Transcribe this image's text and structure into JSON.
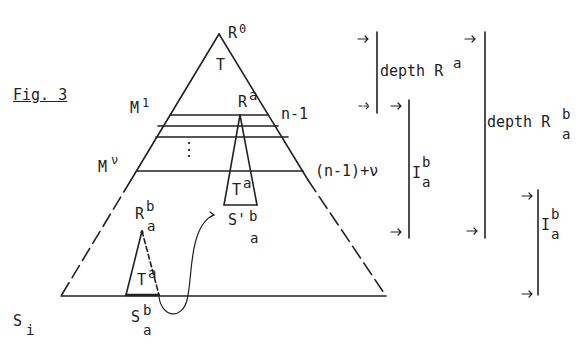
{
  "figure": {
    "caption": "Fig. 3",
    "colors": {
      "ink": "#222222",
      "background": "#ffffff"
    }
  },
  "triangle": {
    "apex_label": "R",
    "apex_sup": "0",
    "body_label": "T",
    "base_label": "S",
    "base_sub": "i"
  },
  "levels": [
    {
      "left_label": "M",
      "left_sup": "1",
      "right_label": "n-1"
    },
    {
      "ellipsis": "⋮"
    },
    {
      "left_label": "M",
      "left_sup": "ν",
      "right_label": "(n-1)+ν"
    }
  ],
  "subtrees": {
    "upper": {
      "apex_label": "R",
      "apex_sup": "a",
      "body_label": "T",
      "body_sup": "a",
      "base_label": "S'",
      "base_sup": "b",
      "base_sub": "a"
    },
    "lower": {
      "apex_label": "R",
      "apex_sup": "b",
      "apex_sub": "a",
      "body_label": "T",
      "body_sup": "a",
      "base_label": "S",
      "base_sup": "b",
      "base_sub": "a"
    }
  },
  "brackets": [
    {
      "label": "depth R",
      "sup": "a"
    },
    {
      "label": "I",
      "sup": "b",
      "sub": "a"
    },
    {
      "label": "depth R",
      "sup": "b",
      "sub": "a"
    },
    {
      "label": "I",
      "sup": "b",
      "sub": "a"
    }
  ],
  "arrow_glyph": "→"
}
